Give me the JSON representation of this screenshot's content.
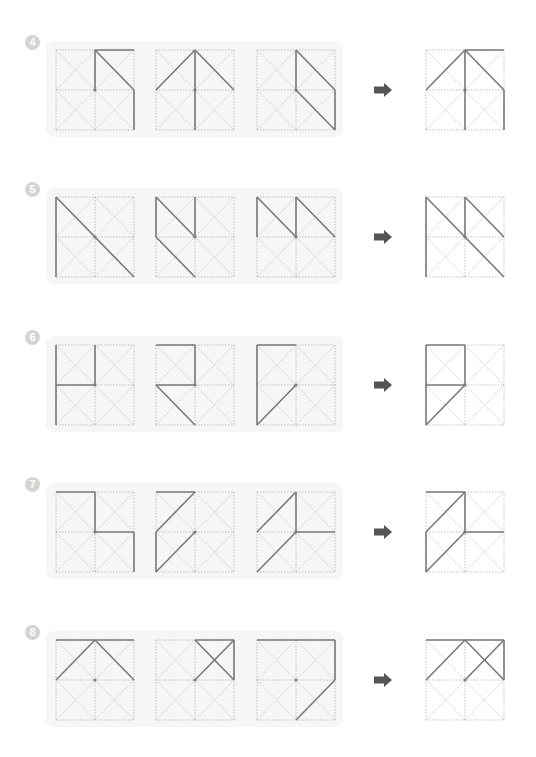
{
  "colors": {
    "panel_bg": "#f6f6f6",
    "guide_line": "#b0b0b0",
    "solid_line": "#7a7a7a",
    "arrow": "#555555",
    "badge": "#d4d4d4"
  },
  "points": {
    "TL": [
      0,
      0
    ],
    "TM": [
      1,
      0
    ],
    "TR": [
      2,
      0
    ],
    "ML": [
      0,
      1
    ],
    "C": [
      1,
      1
    ],
    "MR": [
      2,
      1
    ],
    "BL": [
      0,
      2
    ],
    "BM": [
      1,
      2
    ],
    "BR": [
      2,
      2
    ]
  },
  "rows": [
    {
      "number": "4",
      "sequence": [
        {
          "segments": [
            [
              "TM",
              "TR"
            ],
            [
              "TM",
              "C"
            ],
            [
              "TM",
              "MR"
            ],
            [
              "MR",
              "BR"
            ]
          ]
        },
        {
          "segments": [
            [
              "ML",
              "TM"
            ],
            [
              "TM",
              "BM"
            ],
            [
              "TM",
              "MR"
            ]
          ]
        },
        {
          "segments": [
            [
              "TM",
              "C"
            ],
            [
              "TM",
              "MR"
            ],
            [
              "MR",
              "BR"
            ],
            [
              "C",
              "BR"
            ]
          ]
        }
      ],
      "answer": {
        "segments": [
          [
            "TM",
            "TR"
          ],
          [
            "ML",
            "TM"
          ],
          [
            "TM",
            "BM"
          ],
          [
            "TM",
            "MR"
          ],
          [
            "MR",
            "BR"
          ]
        ]
      }
    },
    {
      "number": "5",
      "sequence": [
        {
          "segments": [
            [
              "TL",
              "BL"
            ],
            [
              "TL",
              "BR"
            ]
          ]
        },
        {
          "segments": [
            [
              "TL",
              "ML"
            ],
            [
              "TL",
              "C"
            ],
            [
              "TM",
              "C"
            ],
            [
              "ML",
              "BM"
            ]
          ]
        },
        {
          "segments": [
            [
              "TL",
              "ML"
            ],
            [
              "TL",
              "C"
            ],
            [
              "TM",
              "C"
            ],
            [
              "TM",
              "MR"
            ]
          ]
        }
      ],
      "answer": {
        "segments": [
          [
            "TL",
            "BL"
          ],
          [
            "TL",
            "BR"
          ],
          [
            "TM",
            "C"
          ],
          [
            "TM",
            "MR"
          ]
        ]
      }
    },
    {
      "number": "6",
      "sequence": [
        {
          "segments": [
            [
              "TM",
              "C"
            ],
            [
              "ML",
              "C"
            ],
            [
              "TL",
              "BL"
            ]
          ]
        },
        {
          "segments": [
            [
              "TL",
              "TM"
            ],
            [
              "TM",
              "C"
            ],
            [
              "ML",
              "C"
            ],
            [
              "ML",
              "BM"
            ]
          ]
        },
        {
          "segments": [
            [
              "TL",
              "TM"
            ],
            [
              "TL",
              "BL"
            ],
            [
              "C",
              "BL"
            ]
          ]
        }
      ],
      "answer": {
        "segments": [
          [
            "TL",
            "TM"
          ],
          [
            "TL",
            "BL"
          ],
          [
            "TM",
            "C"
          ],
          [
            "ML",
            "C"
          ],
          [
            "C",
            "BL"
          ]
        ]
      }
    },
    {
      "number": "7",
      "sequence": [
        {
          "segments": [
            [
              "TL",
              "TM"
            ],
            [
              "TM",
              "C"
            ],
            [
              "C",
              "MR"
            ],
            [
              "MR",
              "BR"
            ]
          ]
        },
        {
          "segments": [
            [
              "TL",
              "TM"
            ],
            [
              "ML",
              "TM"
            ],
            [
              "ML",
              "BL"
            ],
            [
              "C",
              "BL"
            ]
          ]
        },
        {
          "segments": [
            [
              "ML",
              "TM"
            ],
            [
              "TM",
              "C"
            ],
            [
              "C",
              "MR"
            ],
            [
              "C",
              "BL"
            ]
          ]
        }
      ],
      "answer": {
        "segments": [
          [
            "TL",
            "TM"
          ],
          [
            "ML",
            "TM"
          ],
          [
            "TM",
            "C"
          ],
          [
            "C",
            "MR"
          ],
          [
            "ML",
            "BL"
          ],
          [
            "C",
            "BL"
          ]
        ]
      }
    },
    {
      "number": "8",
      "sequence": [
        {
          "segments": [
            [
              "TL",
              "TR"
            ],
            [
              "ML",
              "TM"
            ],
            [
              "TM",
              "MR"
            ]
          ]
        },
        {
          "segments": [
            [
              "TM",
              "TR"
            ],
            [
              "TR",
              "MR"
            ],
            [
              "TM",
              "MR"
            ],
            [
              "C",
              "TR"
            ]
          ]
        },
        {
          "segments": [
            [
              "TL",
              "TR"
            ],
            [
              "TR",
              "MR"
            ],
            [
              "MR",
              "BM"
            ]
          ]
        }
      ],
      "answer": {
        "segments": [
          [
            "TL",
            "TR"
          ],
          [
            "ML",
            "TM"
          ],
          [
            "TM",
            "MR"
          ],
          [
            "C",
            "TR"
          ],
          [
            "TR",
            "MR"
          ]
        ]
      }
    }
  ],
  "layout": {
    "row_tops": [
      49,
      196,
      344,
      491,
      639
    ],
    "box_lefts": [
      55,
      155,
      256
    ],
    "answer_left": 425,
    "arrow_icon": "right-arrow-icon"
  }
}
